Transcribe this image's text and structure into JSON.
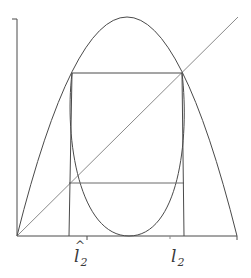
{
  "diagram": {
    "stroke_color": "#4a4a4a",
    "diagonal_color": "#8a8a8a",
    "background": "#ffffff",
    "axes": {
      "origin": [
        17,
        236
      ],
      "x_end": [
        237,
        236
      ],
      "y_top": [
        17,
        19
      ]
    },
    "labels": {
      "left_marker": {
        "base": "l",
        "hat": "^",
        "subscript": "2",
        "text": "Î₂"
      },
      "right_marker": {
        "base": "l",
        "subscript": "2",
        "text": "l₂"
      }
    },
    "elements": [
      "x-axis",
      "y-axis",
      "diagonal y=x",
      "outer parabola f(x)",
      "inner curve f²(x)",
      "upper horizontal box edge",
      "lower horizontal segment",
      "left vertical line at Î₂",
      "right vertical line at l₂",
      "tick marks"
    ]
  }
}
